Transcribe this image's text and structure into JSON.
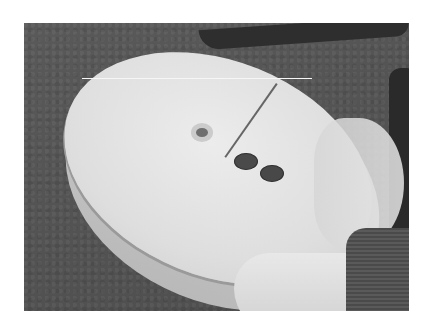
{
  "image": {
    "description": "Grayscale photograph of a cracked white disc-shaped object with three holes, held by a hand over gravel ground",
    "elements": {
      "background": "gravel ground",
      "subject": "white disc with holes and crack",
      "hand": "hand holding disc",
      "sleeve": "knitted sleeve"
    }
  }
}
